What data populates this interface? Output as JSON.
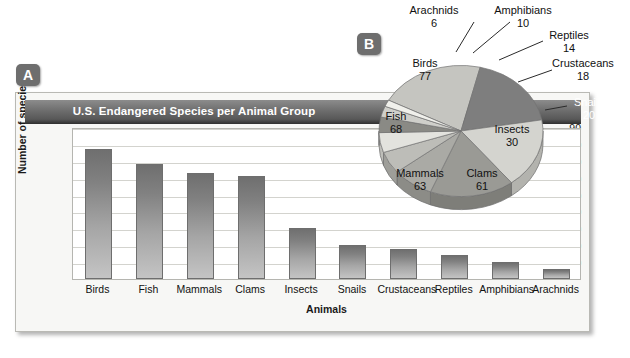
{
  "markers": {
    "a": "A",
    "b": "B"
  },
  "chart_data": [
    {
      "type": "bar",
      "panel": "A",
      "title": "U.S. Endangered Species per Animal Group",
      "xlabel": "Animals",
      "ylabel": "Number of species",
      "ylim": [
        0,
        90
      ],
      "yticks": [
        90,
        80,
        70,
        60,
        50,
        40,
        30,
        20,
        10
      ],
      "grid": true,
      "legend": "none",
      "categories": [
        "Birds",
        "Fish",
        "Mammals",
        "Clams",
        "Insects",
        "Snails",
        "Crustaceans",
        "Reptiles",
        "Amphibians",
        "Arachnids"
      ],
      "values": [
        77,
        68,
        63,
        61,
        30,
        20,
        18,
        14,
        10,
        6
      ]
    },
    {
      "type": "pie",
      "panel": "B",
      "title": "",
      "labels": [
        "Birds",
        "Fish",
        "Mammals",
        "Clams",
        "Insects",
        "Snails",
        "Crustaceans",
        "Reptiles",
        "Amphibians",
        "Arachnids"
      ],
      "values": [
        77,
        68,
        63,
        61,
        30,
        20,
        18,
        14,
        10,
        6
      ],
      "total": 367,
      "legend": "labels-on-slices-and-leader-lines"
    }
  ],
  "bar_chart": {
    "title": "U.S. Endangered Species per Animal Group",
    "y_axis_title": "Number of species",
    "x_axis_title": "Animals",
    "y_ticks": [
      "90",
      "80",
      "70",
      "60",
      "50",
      "40",
      "30",
      "20",
      "10"
    ],
    "bars": [
      {
        "label": "Birds",
        "value": 77
      },
      {
        "label": "Fish",
        "value": 68
      },
      {
        "label": "Mammals",
        "value": 63
      },
      {
        "label": "Clams",
        "value": 61
      },
      {
        "label": "Insects",
        "value": 30
      },
      {
        "label": "Snails",
        "value": 20
      },
      {
        "label": "Crustaceans",
        "value": 18
      },
      {
        "label": "Reptiles",
        "value": 14
      },
      {
        "label": "Amphibians",
        "value": 10
      },
      {
        "label": "Arachnids",
        "value": 6
      }
    ]
  },
  "pie_chart": {
    "slices": [
      {
        "label": "Birds",
        "value": "77",
        "value_num": 77
      },
      {
        "label": "Fish",
        "value": "68",
        "value_num": 68
      },
      {
        "label": "Mammals",
        "value": "63",
        "value_num": 63
      },
      {
        "label": "Clams",
        "value": "61",
        "value_num": 61
      },
      {
        "label": "Insects",
        "value": "30",
        "value_num": 30
      },
      {
        "label": "Snails",
        "value": "20",
        "value_num": 20
      },
      {
        "label": "Crustaceans",
        "value": "18",
        "value_num": 18
      },
      {
        "label": "Reptiles",
        "value": "14",
        "value_num": 14
      },
      {
        "label": "Amphibians",
        "value": "10",
        "value_num": 10
      },
      {
        "label": "Arachnids",
        "value": "6",
        "value_num": 6
      }
    ]
  },
  "colors": {
    "title_bar_dark": "#585858",
    "marker_gray": "#6e6e6e",
    "bar_gray_top": "#6f6f6f",
    "bar_gray_bottom": "#c4c4c4",
    "pie_light": "#c9c9c4",
    "pie_dark": "#7d7d7d",
    "panel_bg": "#f7f7f5",
    "gridline": "#d3d3ce"
  }
}
